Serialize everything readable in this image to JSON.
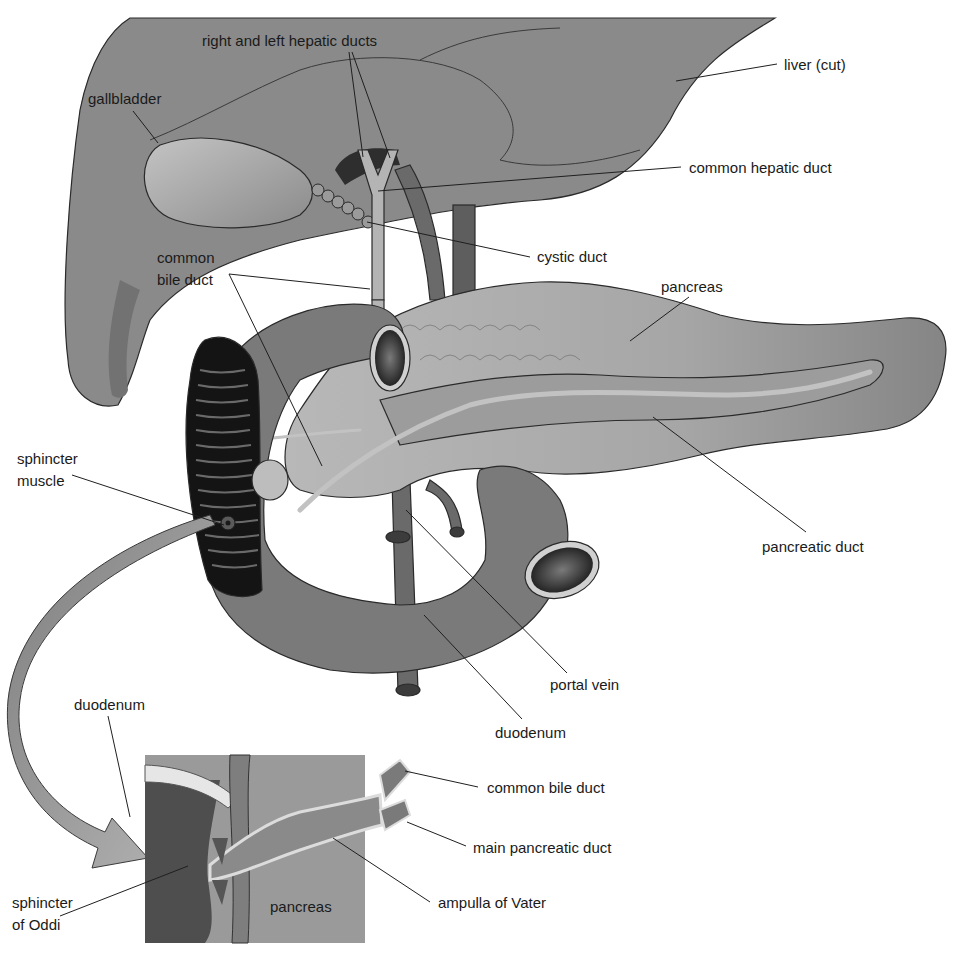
{
  "diagram": {
    "palette": {
      "background": "#ffffff",
      "liver": "#8a8a8a",
      "liver_shadow": "#6f6f6f",
      "gallbladder": "#a3a3a3",
      "duct": "#b4b4b4",
      "vessel": "#6a6a6a",
      "pancreas": "#a8a8a8",
      "pancreas_tail": "#8e8e8e",
      "duodenum": "#7a7a7a",
      "duodenum_inner": "#1e1e1e",
      "inset_pancreas": "#9a9a9a",
      "inset_duodenum": "#4e4e4e",
      "ink": "#1a1a1a"
    },
    "labels": [
      {
        "id": "right-left-hepatic-ducts",
        "text": "right and left hepatic ducts",
        "x": 202,
        "y": 46,
        "anchor": "start"
      },
      {
        "id": "liver-cut",
        "text": "liver (cut)",
        "x": 784,
        "y": 70,
        "anchor": "start"
      },
      {
        "id": "gallbladder",
        "text": "gallbladder",
        "x": 88,
        "y": 104,
        "anchor": "start"
      },
      {
        "id": "common-hepatic-duct",
        "text": "common hepatic duct",
        "x": 689,
        "y": 173,
        "anchor": "start"
      },
      {
        "id": "cystic-duct",
        "text": "cystic duct",
        "x": 537,
        "y": 262,
        "anchor": "start"
      },
      {
        "id": "common-bile-duct-upper-1",
        "text": "common",
        "x": 157,
        "y": 263,
        "anchor": "start"
      },
      {
        "id": "common-bile-duct-upper-2",
        "text": "bile duct",
        "x": 157,
        "y": 285,
        "anchor": "start"
      },
      {
        "id": "pancreas-upper",
        "text": "pancreas",
        "x": 661,
        "y": 292,
        "anchor": "start"
      },
      {
        "id": "sphincter-muscle-1",
        "text": "sphincter",
        "x": 17,
        "y": 464,
        "anchor": "start"
      },
      {
        "id": "sphincter-muscle-2",
        "text": "muscle",
        "x": 17,
        "y": 486,
        "anchor": "start"
      },
      {
        "id": "pancreatic-duct",
        "text": "pancreatic duct",
        "x": 762,
        "y": 552,
        "anchor": "start"
      },
      {
        "id": "portal-vein",
        "text": "portal vein",
        "x": 550,
        "y": 690,
        "anchor": "start"
      },
      {
        "id": "duodenum-upper",
        "text": "duodenum",
        "x": 495,
        "y": 738,
        "anchor": "start"
      },
      {
        "id": "duodenum-inset",
        "text": "duodenum",
        "x": 74,
        "y": 710,
        "anchor": "start"
      },
      {
        "id": "common-bile-duct-inset",
        "text": "common bile duct",
        "x": 487,
        "y": 793,
        "anchor": "start"
      },
      {
        "id": "main-pancreatic-duct",
        "text": "main pancreatic duct",
        "x": 473,
        "y": 853,
        "anchor": "start"
      },
      {
        "id": "ampulla-of-vater",
        "text": "ampulla of Vater",
        "x": 438,
        "y": 908,
        "anchor": "start"
      },
      {
        "id": "sphincter-oddi-1",
        "text": "sphincter",
        "x": 12,
        "y": 908,
        "anchor": "start"
      },
      {
        "id": "sphincter-oddi-2",
        "text": "of Oddi",
        "x": 12,
        "y": 930,
        "anchor": "start"
      },
      {
        "id": "pancreas-inset",
        "text": "pancreas",
        "x": 270,
        "y": 912,
        "anchor": "start"
      }
    ],
    "leader_lines": [
      {
        "for": "right-left-hepatic-ducts",
        "points": [
          [
            349,
            52
          ],
          [
            363,
            157
          ]
        ]
      },
      {
        "for": "right-left-hepatic-ducts",
        "points": [
          [
            352,
            52
          ],
          [
            390,
            158
          ]
        ]
      },
      {
        "for": "liver-cut",
        "points": [
          [
            777,
            64
          ],
          [
            676,
            81
          ]
        ]
      },
      {
        "for": "gallbladder",
        "points": [
          [
            133,
            111
          ],
          [
            158,
            143
          ]
        ]
      },
      {
        "for": "common-hepatic-duct",
        "points": [
          [
            681,
            167
          ],
          [
            378,
            191
          ]
        ]
      },
      {
        "for": "cystic-duct",
        "points": [
          [
            530,
            257
          ],
          [
            367,
            222
          ]
        ]
      },
      {
        "for": "common-bile-duct-upper",
        "points": [
          [
            229,
            274
          ],
          [
            370,
            289
          ]
        ]
      },
      {
        "for": "common-bile-duct-upper",
        "points": [
          [
            229,
            274
          ],
          [
            322,
            466
          ]
        ]
      },
      {
        "for": "pancreas-upper",
        "points": [
          [
            689,
            297
          ],
          [
            630,
            341
          ]
        ]
      },
      {
        "for": "sphincter-muscle",
        "points": [
          [
            72,
            475
          ],
          [
            224,
            525
          ]
        ]
      },
      {
        "for": "pancreatic-duct",
        "points": [
          [
            806,
            532
          ],
          [
            653,
            417
          ]
        ]
      },
      {
        "for": "portal-vein",
        "points": [
          [
            567,
            673
          ],
          [
            406,
            510
          ]
        ]
      },
      {
        "for": "duodenum-upper",
        "points": [
          [
            522,
            719
          ],
          [
            424,
            615
          ]
        ]
      },
      {
        "for": "duodenum-inset",
        "points": [
          [
            108,
            716
          ],
          [
            130,
            817
          ]
        ]
      },
      {
        "for": "common-bile-duct-inset",
        "points": [
          [
            478,
            787
          ],
          [
            405,
            771
          ]
        ]
      },
      {
        "for": "main-pancreatic-duct",
        "points": [
          [
            466,
            846
          ],
          [
            407,
            822
          ]
        ]
      },
      {
        "for": "ampulla-of-vater",
        "points": [
          [
            430,
            902
          ],
          [
            333,
            838
          ]
        ]
      },
      {
        "for": "sphincter-oddi",
        "points": [
          [
            60,
            916
          ],
          [
            188,
            866
          ]
        ]
      }
    ],
    "inset": {
      "x": 145,
      "y": 755,
      "width": 220,
      "height": 188
    },
    "connector_arrow": {
      "from": [
        205,
        530
      ],
      "to": [
        175,
        860
      ]
    }
  }
}
